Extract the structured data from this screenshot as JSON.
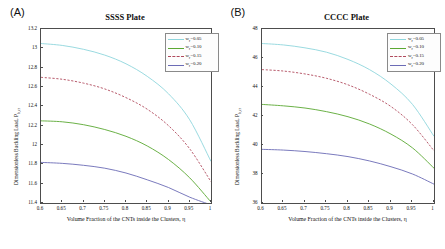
{
  "figure": {
    "panels": [
      {
        "panel_label": "(A)",
        "title": "SSSS Plate",
        "xlabel": "Volume Fraction of the CNTs inside the Clusters, η",
        "ylabel_main": "Dimensionless Buckling Load, P",
        "ylabel_sub": "b,cr",
        "xticks": [
          "0.6",
          "0.65",
          "0.7",
          "0.75",
          "0.8",
          "0.85",
          "0.9",
          "0.95",
          "1"
        ],
        "yticks": [
          "11.4",
          "11.6",
          "11.8",
          "12",
          "12.2",
          "12.4",
          "12.6",
          "12.8",
          "13",
          "13.2"
        ],
        "legend": [
          {
            "label_prefix": "w",
            "label_sub": "r",
            "label_value": "=0.05",
            "color": "#8fd6dd",
            "style": "solid"
          },
          {
            "label_prefix": "w",
            "label_sub": "r",
            "label_value": "=0.10",
            "color": "#5aa832",
            "style": "solid"
          },
          {
            "label_prefix": "w",
            "label_sub": "r",
            "label_value": "=0.15",
            "color": "#b0495c",
            "style": "dashed"
          },
          {
            "label_prefix": "w",
            "label_sub": "r",
            "label_value": "=0.20",
            "color": "#6b6bb5",
            "style": "solid"
          }
        ]
      },
      {
        "panel_label": "(B)",
        "title": "CCCC Plate",
        "xlabel": "Volume Fraction of the CNTs inside the Clusters, η",
        "ylabel_main": "Dimensionless Buckling Load, P",
        "ylabel_sub": "b,cr",
        "xticks": [
          "0.6",
          "0.65",
          "0.7",
          "0.75",
          "0.8",
          "0.85",
          "0.9",
          "0.95",
          "1"
        ],
        "yticks": [
          "36",
          "38",
          "40",
          "42",
          "44",
          "46",
          "48"
        ],
        "legend": [
          {
            "label_prefix": "w",
            "label_sub": "r",
            "label_value": "=0.05",
            "color": "#8fd6dd",
            "style": "solid"
          },
          {
            "label_prefix": "w",
            "label_sub": "r",
            "label_value": "=0.10",
            "color": "#5aa832",
            "style": "solid"
          },
          {
            "label_prefix": "w",
            "label_sub": "r",
            "label_value": "=0.15",
            "color": "#b0495c",
            "style": "dashed"
          },
          {
            "label_prefix": "w",
            "label_sub": "r",
            "label_value": "=0.20",
            "color": "#6b6bb5",
            "style": "solid"
          }
        ]
      }
    ]
  },
  "chart_data": [
    {
      "type": "line",
      "title": "SSSS Plate",
      "panel": "(A)",
      "xlabel": "Volume Fraction of the CNTs inside the Clusters, η",
      "ylabel": "Dimensionless Buckling Load, P_b,cr",
      "xlim": [
        0.6,
        1.0
      ],
      "ylim": [
        11.4,
        13.2
      ],
      "grid": false,
      "legend_position": "upper-right",
      "x": [
        0.6,
        0.65,
        0.7,
        0.75,
        0.8,
        0.85,
        0.9,
        0.95,
        1.0
      ],
      "series": [
        {
          "name": "w_r=0.05",
          "color": "#8fd6dd",
          "style": "solid",
          "values": [
            13.05,
            13.03,
            12.99,
            12.93,
            12.84,
            12.71,
            12.53,
            12.26,
            11.83
          ]
        },
        {
          "name": "w_r=0.10",
          "color": "#5aa832",
          "style": "solid",
          "values": [
            12.25,
            12.24,
            12.21,
            12.16,
            12.09,
            11.99,
            11.85,
            11.66,
            11.41
          ]
        },
        {
          "name": "w_r=0.15",
          "color": "#b0495c",
          "style": "dashed",
          "values": [
            12.7,
            12.68,
            12.64,
            12.58,
            12.49,
            12.37,
            12.2,
            11.96,
            11.62
          ]
        },
        {
          "name": "w_r=0.20",
          "color": "#6b6bb5",
          "style": "solid",
          "values": [
            11.82,
            11.81,
            11.79,
            11.76,
            11.71,
            11.64,
            11.56,
            11.46,
            11.38
          ]
        }
      ]
    },
    {
      "type": "line",
      "title": "CCCC Plate",
      "panel": "(B)",
      "xlabel": "Volume Fraction of the CNTs inside the Clusters, η",
      "ylabel": "Dimensionless Buckling Load, P_b,cr",
      "xlim": [
        0.6,
        1.0
      ],
      "ylim": [
        36,
        48
      ],
      "grid": false,
      "legend_position": "upper-right",
      "x": [
        0.6,
        0.65,
        0.7,
        0.75,
        0.8,
        0.85,
        0.9,
        0.95,
        1.0
      ],
      "series": [
        {
          "name": "w_r=0.05",
          "color": "#8fd6dd",
          "style": "solid",
          "values": [
            47.0,
            46.9,
            46.7,
            46.4,
            45.9,
            45.2,
            44.2,
            42.8,
            40.6
          ]
        },
        {
          "name": "w_r=0.10",
          "color": "#5aa832",
          "style": "solid",
          "values": [
            42.8,
            42.7,
            42.55,
            42.3,
            41.95,
            41.45,
            40.75,
            39.8,
            38.4
          ]
        },
        {
          "name": "w_r=0.15",
          "color": "#b0495c",
          "style": "dashed",
          "values": [
            45.2,
            45.1,
            44.9,
            44.6,
            44.15,
            43.5,
            42.65,
            41.4,
            39.6
          ]
        },
        {
          "name": "w_r=0.20",
          "color": "#6b6bb5",
          "style": "solid",
          "values": [
            39.7,
            39.65,
            39.55,
            39.4,
            39.2,
            38.9,
            38.5,
            38.0,
            37.3
          ]
        }
      ]
    }
  ]
}
